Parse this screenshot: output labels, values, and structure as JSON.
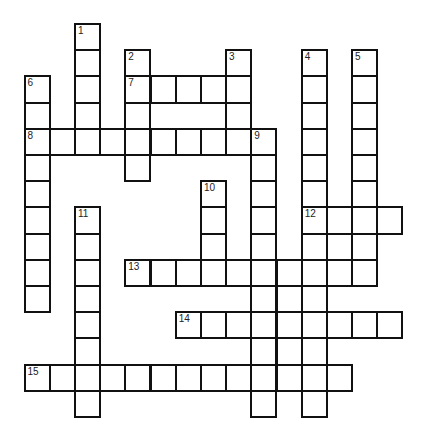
{
  "puzzle": {
    "type": "crossword",
    "grid": {
      "origin_x": 24.5,
      "origin_y": 24,
      "cell_width": 25.2,
      "cell_height": 26.2,
      "columns": 15,
      "rows": 15
    },
    "colors": {
      "line": "#111111",
      "cell_fill": "#ffffff",
      "background": "#ffffff"
    },
    "rows": [
      {
        "row": 0,
        "cols": [
          2
        ]
      },
      {
        "row": 1,
        "cols": [
          2,
          4,
          8,
          11,
          13
        ]
      },
      {
        "row": 2,
        "cols": [
          0,
          2,
          4,
          5,
          6,
          7,
          8,
          11,
          13
        ]
      },
      {
        "row": 3,
        "cols": [
          0,
          2,
          4,
          8,
          11,
          13
        ]
      },
      {
        "row": 4,
        "cols": [
          0,
          1,
          2,
          3,
          4,
          5,
          6,
          7,
          8,
          9,
          11,
          13
        ]
      },
      {
        "row": 5,
        "cols": [
          0,
          4,
          9,
          11,
          13
        ]
      },
      {
        "row": 6,
        "cols": [
          0,
          7,
          9,
          11,
          13
        ]
      },
      {
        "row": 7,
        "cols": [
          0,
          2,
          7,
          9,
          11,
          12,
          13,
          14
        ]
      },
      {
        "row": 8,
        "cols": [
          0,
          2,
          7,
          9,
          11,
          12,
          13
        ]
      },
      {
        "row": 9,
        "cols": [
          0,
          2,
          4,
          5,
          6,
          7,
          8,
          9,
          10,
          11,
          12,
          13
        ]
      },
      {
        "row": 10,
        "cols": [
          0,
          2,
          9,
          10,
          11
        ]
      },
      {
        "row": 11,
        "cols": [
          2,
          6,
          7,
          8,
          9,
          10,
          11,
          12,
          13,
          14
        ]
      },
      {
        "row": 12,
        "cols": [
          2,
          9,
          10,
          11
        ]
      },
      {
        "row": 13,
        "cols": [
          0,
          1,
          2,
          3,
          4,
          5,
          6,
          7,
          8,
          9,
          10,
          11,
          12
        ]
      },
      {
        "row": 14,
        "cols": [
          2,
          9,
          11
        ]
      }
    ],
    "numbers": [
      {
        "label": "1",
        "row": 0,
        "col": 2
      },
      {
        "label": "2",
        "row": 1,
        "col": 4
      },
      {
        "label": "3",
        "row": 1,
        "col": 8
      },
      {
        "label": "4",
        "row": 1,
        "col": 11
      },
      {
        "label": "5",
        "row": 1,
        "col": 13
      },
      {
        "label": "6",
        "row": 2,
        "col": 0
      },
      {
        "label": "7",
        "row": 2,
        "col": 4
      },
      {
        "label": "8",
        "row": 4,
        "col": 0
      },
      {
        "label": "9",
        "row": 4,
        "col": 9
      },
      {
        "label": "10",
        "row": 6,
        "col": 7
      },
      {
        "label": "11",
        "row": 7,
        "col": 2
      },
      {
        "label": "12",
        "row": 7,
        "col": 11
      },
      {
        "label": "13",
        "row": 9,
        "col": 4
      },
      {
        "label": "14",
        "row": 11,
        "col": 6
      },
      {
        "label": "15",
        "row": 13,
        "col": 0
      }
    ],
    "words": {
      "across": [
        {
          "number": "7",
          "row": 2,
          "col": 4,
          "length": 5
        },
        {
          "number": "8",
          "row": 4,
          "col": 0,
          "length": 9
        },
        {
          "number": "12",
          "row": 7,
          "col": 11,
          "length": 4
        },
        {
          "number": "13",
          "row": 9,
          "col": 4,
          "length": 10
        },
        {
          "number": "14",
          "row": 11,
          "col": 6,
          "length": 9
        },
        {
          "number": "15",
          "row": 13,
          "col": 0,
          "length": 13
        }
      ],
      "down": [
        {
          "number": "1",
          "row": 0,
          "col": 2,
          "length": 5
        },
        {
          "number": "2",
          "row": 1,
          "col": 4,
          "length": 5
        },
        {
          "number": "3",
          "row": 1,
          "col": 8,
          "length": 4
        },
        {
          "number": "4",
          "row": 1,
          "col": 11,
          "length": 14
        },
        {
          "number": "5",
          "row": 1,
          "col": 13,
          "length": 9
        },
        {
          "number": "6",
          "row": 2,
          "col": 0,
          "length": 9
        },
        {
          "number": "9",
          "row": 4,
          "col": 9,
          "length": 11
        },
        {
          "number": "10",
          "row": 6,
          "col": 7,
          "length": 4
        },
        {
          "number": "11",
          "row": 7,
          "col": 2,
          "length": 8
        }
      ]
    }
  }
}
